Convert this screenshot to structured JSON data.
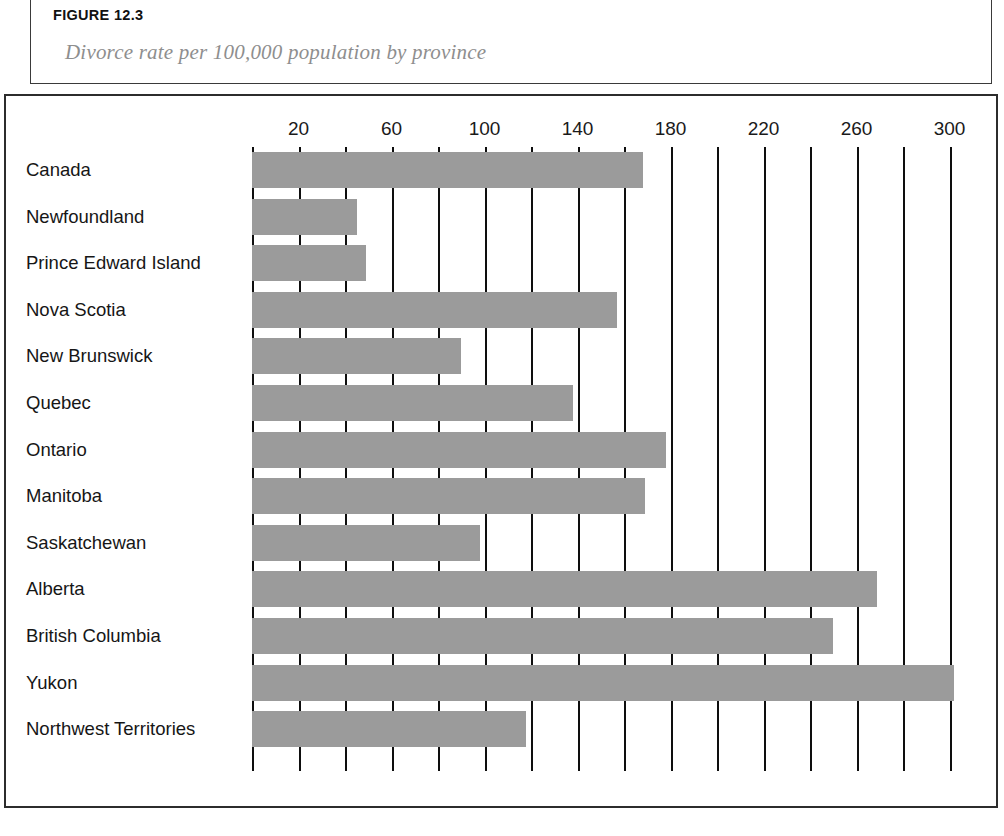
{
  "figure": {
    "number": "FIGURE 12.3",
    "subtitle": "Divorce rate per 100,000 population by province"
  },
  "chart_data": {
    "type": "bar",
    "orientation": "horizontal",
    "title": "Divorce rate per 100,000 population by province",
    "xlabel": "",
    "ylabel": "",
    "xlim": [
      0,
      310
    ],
    "grid": true,
    "grid_interval": 20,
    "legend": "none",
    "tick_labels": [
      "20",
      "60",
      "100",
      "140",
      "180",
      "220",
      "260",
      "300"
    ],
    "tick_values": [
      20,
      60,
      100,
      140,
      180,
      220,
      260,
      300
    ],
    "bar_color": "#9b9b9b",
    "grid_color": "#0e0e0e",
    "categories": [
      "Canada",
      "Newfoundland",
      "Prince Edward Island",
      "Nova Scotia",
      "New Brunswick",
      "Quebec",
      "Ontario",
      "Manitoba",
      "Saskatchewan",
      "Alberta",
      "British Columbia",
      "Yukon",
      "Northwest Territories"
    ],
    "values": [
      168,
      45,
      49,
      157,
      90,
      138,
      178,
      169,
      98,
      269,
      250,
      302,
      118
    ]
  }
}
